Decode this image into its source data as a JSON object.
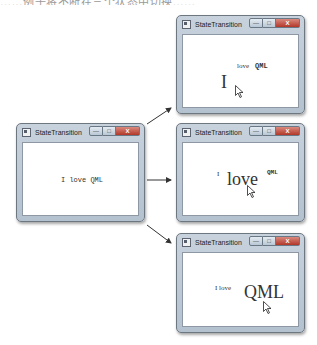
{
  "caption_fragment": "……例子将不断在三个状态中切换……",
  "windows": [
    {
      "id": "initial",
      "title": "StateTransition",
      "controls": {
        "minimize": "—",
        "maximize": "□",
        "close": "X"
      },
      "words": [
        {
          "text": "I love QML",
          "size": 7
        }
      ]
    },
    {
      "id": "state-I",
      "title": "StateTransition",
      "controls": {
        "minimize": "—",
        "maximize": "□",
        "close": "X"
      },
      "words": [
        {
          "text": "I",
          "size": 18
        },
        {
          "text": "love",
          "size": 7
        },
        {
          "text": "QML",
          "size": 7
        }
      ]
    },
    {
      "id": "state-love",
      "title": "StateTransition",
      "controls": {
        "minimize": "—",
        "maximize": "□",
        "close": "X"
      },
      "words": [
        {
          "text": "I",
          "size": 7
        },
        {
          "text": "love",
          "size": 18
        },
        {
          "text": "QML",
          "size": 6
        }
      ]
    },
    {
      "id": "state-QML",
      "title": "StateTransition",
      "controls": {
        "minimize": "—",
        "maximize": "□",
        "close": "X"
      },
      "words": [
        {
          "text": "I love",
          "size": 7
        },
        {
          "text": "QML",
          "size": 18
        }
      ]
    }
  ],
  "colors": {
    "arrow": "#333333",
    "frame": "#b9c5d2",
    "close_button": "#c0473a"
  }
}
